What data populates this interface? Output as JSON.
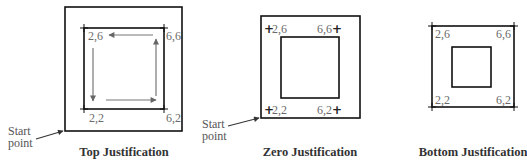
{
  "diagrams": [
    {
      "caption": "Top Justification",
      "corner_labels": {
        "top_left": "2,6",
        "top_right": "6,6",
        "bottom_left": "2,2",
        "bottom_right": "6,2"
      },
      "start_label": [
        "Start",
        "point"
      ],
      "has_direction_arrows": true
    },
    {
      "caption": "Zero Justification",
      "corner_labels": {
        "top_left": "2,6",
        "top_right": "6,6",
        "bottom_left": "2,2",
        "bottom_right": "6,2"
      },
      "start_label": [
        "Start",
        "point"
      ],
      "corner_marker": "+"
    },
    {
      "caption": "Bottom Justification",
      "corner_labels": {
        "top_left": "2,6",
        "top_right": "6,6",
        "bottom_left": "2,2",
        "bottom_right": "6,2"
      }
    }
  ],
  "colors": {
    "stroke": "#111111",
    "arrow": "#777777",
    "label": "#6a6a6a"
  }
}
